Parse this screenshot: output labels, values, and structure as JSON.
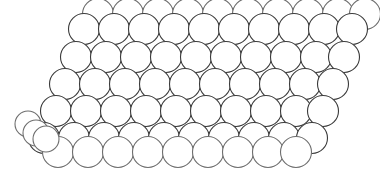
{
  "figure": {
    "description": "Stacked arrangement of identical outlined spheres forming a close-packed crystal lattice viewed at an oblique angle",
    "background_color": "#ffffff",
    "stroke_color": "#3b3b3b",
    "stroke_color_light": "#6e6e6e",
    "fill_color": "#ffffff",
    "stroke_width": 1.1,
    "canvas": {
      "width": 380,
      "height": 169
    },
    "sphere_radius": 15.5,
    "small_sphere_radius": 13.0,
    "row_count": 5,
    "layers": [
      {
        "name": "back-row-top",
        "label": "Partially hidden upper back row",
        "radius": 15.5,
        "stroke": "#6e6e6e",
        "centers": [
          [
            98,
            14
          ],
          [
            128,
            14
          ],
          [
            158,
            14
          ],
          [
            188,
            14
          ],
          [
            218,
            14
          ],
          [
            248,
            14
          ],
          [
            278,
            14
          ],
          [
            308,
            14
          ],
          [
            338,
            14
          ],
          [
            365,
            14
          ]
        ]
      },
      {
        "name": "row-1",
        "label": "Top visible row",
        "radius": 15.5,
        "stroke": "#3b3b3b",
        "centers": [
          [
            84,
            29
          ],
          [
            114,
            29
          ],
          [
            144,
            29
          ],
          [
            174,
            29
          ],
          [
            204,
            29
          ],
          [
            234,
            29
          ],
          [
            264,
            29
          ],
          [
            294,
            29
          ],
          [
            324,
            29
          ],
          [
            352,
            29
          ]
        ]
      },
      {
        "name": "row-2",
        "label": "Second row",
        "radius": 15.5,
        "stroke": "#3b3b3b",
        "centers": [
          [
            76,
            57
          ],
          [
            106,
            57
          ],
          [
            136,
            57
          ],
          [
            166,
            57
          ],
          [
            196,
            57
          ],
          [
            226,
            57
          ],
          [
            256,
            57
          ],
          [
            286,
            57
          ],
          [
            316,
            57
          ],
          [
            344,
            57
          ]
        ]
      },
      {
        "name": "row-3",
        "label": "Middle row",
        "radius": 15.5,
        "stroke": "#3b3b3b",
        "centers": [
          [
            65,
            84
          ],
          [
            95,
            84
          ],
          [
            125,
            84
          ],
          [
            155,
            84
          ],
          [
            185,
            84
          ],
          [
            215,
            84
          ],
          [
            245,
            84
          ],
          [
            275,
            84
          ],
          [
            305,
            84
          ],
          [
            333,
            84
          ]
        ]
      },
      {
        "name": "row-4",
        "label": "Fourth row",
        "radius": 15.5,
        "stroke": "#3b3b3b",
        "centers": [
          [
            56,
            111
          ],
          [
            86,
            111
          ],
          [
            116,
            111
          ],
          [
            146,
            111
          ],
          [
            176,
            111
          ],
          [
            206,
            111
          ],
          [
            236,
            111
          ],
          [
            266,
            111
          ],
          [
            296,
            111
          ],
          [
            323,
            111
          ]
        ]
      },
      {
        "name": "row-5",
        "label": "Bottom visible row",
        "radius": 15.5,
        "stroke": "#3b3b3b",
        "centers": [
          [
            44,
            138
          ],
          [
            74,
            138
          ],
          [
            104,
            138
          ],
          [
            134,
            138
          ],
          [
            164,
            138
          ],
          [
            194,
            138
          ],
          [
            224,
            138
          ],
          [
            254,
            138
          ],
          [
            284,
            138
          ],
          [
            312,
            138
          ]
        ]
      },
      {
        "name": "back-row-bottom",
        "label": "Partially hidden lower back row",
        "radius": 15.5,
        "stroke": "#6e6e6e",
        "centers": [
          [
            58,
            152
          ],
          [
            88,
            152
          ],
          [
            118,
            152
          ],
          [
            148,
            152
          ],
          [
            178,
            152
          ],
          [
            208,
            152
          ],
          [
            238,
            152
          ],
          [
            268,
            152
          ],
          [
            296,
            152
          ]
        ]
      },
      {
        "name": "corner-spheres",
        "label": "Detached lower-left corner spheres",
        "radius": 13.0,
        "stroke": "#6e6e6e",
        "centers": [
          [
            28,
            124
          ],
          [
            36,
            133
          ],
          [
            46,
            139
          ]
        ]
      }
    ]
  }
}
